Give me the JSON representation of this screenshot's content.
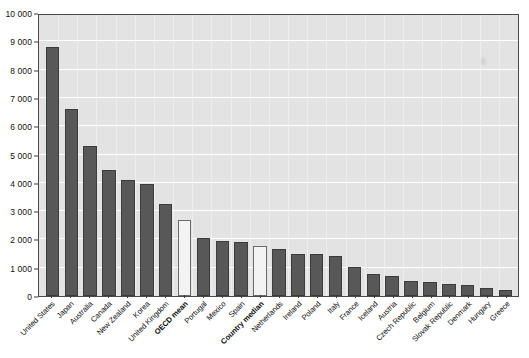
{
  "chart_data": {
    "type": "bar",
    "title": "",
    "subtitle": "",
    "xlabel": "",
    "ylabel": "",
    "ylim": [
      0,
      10000
    ],
    "grid": true,
    "legend": "none",
    "y_ticks": [
      "0",
      "1 000",
      "2 000",
      "3 000",
      "4 000",
      "5 000",
      "6 000",
      "7 000",
      "8 000",
      "9 000",
      "10 000"
    ],
    "y_tick_values": [
      0,
      1000,
      2000,
      3000,
      4000,
      5000,
      6000,
      7000,
      8000,
      9000,
      10000
    ],
    "categories": [
      "United States",
      "Japan",
      "Australia",
      "Canada",
      "New Zealand",
      "Korea",
      "United Kingdom",
      "OECD mean",
      "Portugal",
      "Mexico",
      "Spain",
      "Country median",
      "Netherlands",
      "Ireland",
      "Poland",
      "Italy",
      "France",
      "Iceland",
      "Austria",
      "Czech Republic",
      "Belgium",
      "Slovak Republic",
      "Denmark",
      "Hungary",
      "Greece"
    ],
    "values": [
      8800,
      6600,
      5300,
      4450,
      4100,
      3950,
      3250,
      2700,
      2050,
      1950,
      1900,
      1750,
      1650,
      1500,
      1480,
      1430,
      1020,
      780,
      720,
      520,
      500,
      420,
      390,
      300,
      200
    ],
    "bar_styles": [
      "dark",
      "dark",
      "dark",
      "dark",
      "dark",
      "dark",
      "dark",
      "light",
      "dark",
      "dark",
      "dark",
      "light",
      "dark",
      "dark",
      "dark",
      "dark",
      "dark",
      "dark",
      "dark",
      "dark",
      "dark",
      "dark",
      "dark",
      "dark",
      "dark"
    ],
    "emphasized_labels": [
      "OECD mean",
      "Country median"
    ],
    "colors": {
      "bar_dark": "#585858",
      "bar_light": "#f3f3f3",
      "plot_background": "#e3e3e3",
      "gridline": "#ffffff",
      "axis": "#4a4a4a",
      "text": "#111111"
    }
  }
}
